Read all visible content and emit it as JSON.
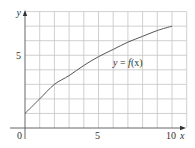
{
  "chart_data": {
    "type": "line",
    "title": "",
    "xlabel": "x",
    "ylabel": "y",
    "xlim": [
      0,
      11
    ],
    "ylim": [
      0,
      8
    ],
    "grid": true,
    "grid_step": 1,
    "x_ticks": [
      {
        "value": 0,
        "label": "0"
      },
      {
        "value": 5,
        "label": "5"
      },
      {
        "value": 10,
        "label": "10"
      }
    ],
    "y_ticks": [
      {
        "value": 5,
        "label": "5"
      }
    ],
    "series": [
      {
        "name": "y = f(x)",
        "x": [
          0,
          1,
          2,
          3,
          4,
          5,
          6,
          7,
          8,
          9,
          10
        ],
        "values": [
          1,
          2,
          3,
          3.6,
          4.3,
          4.9,
          5.4,
          5.9,
          6.3,
          6.7,
          7
        ]
      }
    ],
    "annotations": [
      {
        "text": "y = f(x)",
        "x": 6.3,
        "y": 4.6
      }
    ],
    "legend": "none"
  },
  "labels": {
    "x_axis": "x",
    "y_axis": "y",
    "origin": "0",
    "x5": "5",
    "x10": "10",
    "y5": "5",
    "curve_y": "y",
    "curve_eq": " = ",
    "curve_f": "f",
    "curve_paren": "(x)"
  },
  "colors": {
    "grid": "#c4c4c4",
    "axis": "#555555",
    "curve": "#555555",
    "text": "#333333"
  }
}
